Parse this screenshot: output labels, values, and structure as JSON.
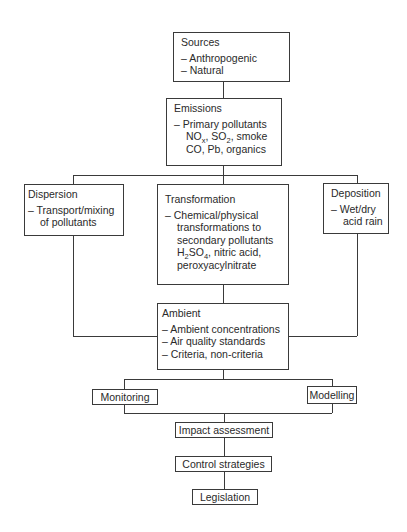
{
  "diagram": {
    "sources": {
      "title": "Sources",
      "items": [
        "– Anthropogenic",
        "– Natural"
      ]
    },
    "emissions": {
      "title": "Emissions",
      "items": [
        "– Primary pollutants"
      ],
      "pollutants_line1": {
        "no": "NO",
        "no_sub": "x",
        "so": ", SO",
        "so_sub": "2",
        "rest": ", smoke"
      },
      "pollutants_line2": "CO, Pb, organics"
    },
    "dispersion": {
      "title": "Dispersion",
      "items": [
        "– Transport/mixing"
      ],
      "cont": [
        "of pollutants"
      ]
    },
    "transformation": {
      "title": "Transformation",
      "items": [
        "– Chemical/physical"
      ],
      "cont": [
        "transformations to",
        "secondary pollutants"
      ],
      "h2so4": {
        "h": "H",
        "h_sub": "2",
        "so": "SO",
        "so_sub": "4",
        "rest": ", nitric acid,"
      },
      "last": "peroxyacylnitrate"
    },
    "deposition": {
      "title": "Deposition",
      "items": [
        "– Wet/dry"
      ],
      "cont": [
        "acid rain"
      ]
    },
    "ambient": {
      "title": "Ambient",
      "items": [
        "– Ambient concentrations",
        "– Air quality standards",
        "– Criteria, non-criteria"
      ]
    },
    "monitoring": "Monitoring",
    "modelling": "Modelling",
    "impact": "Impact assessment",
    "control": "Control strategies",
    "legislation": "Legislation"
  }
}
